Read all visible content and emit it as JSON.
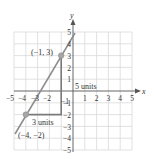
{
  "graph": {
    "x_axis_label": "x",
    "y_axis_label": "y",
    "x_ticks": [
      "−5",
      "−4",
      "−3",
      "−2",
      "−1",
      "1",
      "2",
      "3",
      "4",
      "5"
    ],
    "y_ticks": [
      "5",
      "4",
      "3",
      "2",
      "1",
      "−1",
      "−2",
      "−3",
      "−4",
      "−5"
    ],
    "points": [
      {
        "label": "(−1, 3)",
        "x": -1,
        "y": 3
      },
      {
        "label": "(−4, −2)",
        "x": -4,
        "y": -2
      }
    ],
    "rise_label": "5 units",
    "run_label": "3 units",
    "colors": {
      "grid": "#d9d9d9",
      "axis": "#555555",
      "line": "#8c8c8c",
      "point": "#a6a6a6",
      "text": "#333333"
    }
  }
}
